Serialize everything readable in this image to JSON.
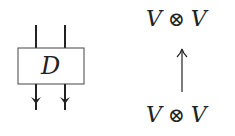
{
  "diagram": {
    "box_label": "D",
    "top_expression": {
      "left": "V",
      "op": "⊗",
      "right": "V"
    },
    "bottom_expression": {
      "left": "V",
      "op": "⊗",
      "right": "V"
    },
    "arrow": "up"
  }
}
